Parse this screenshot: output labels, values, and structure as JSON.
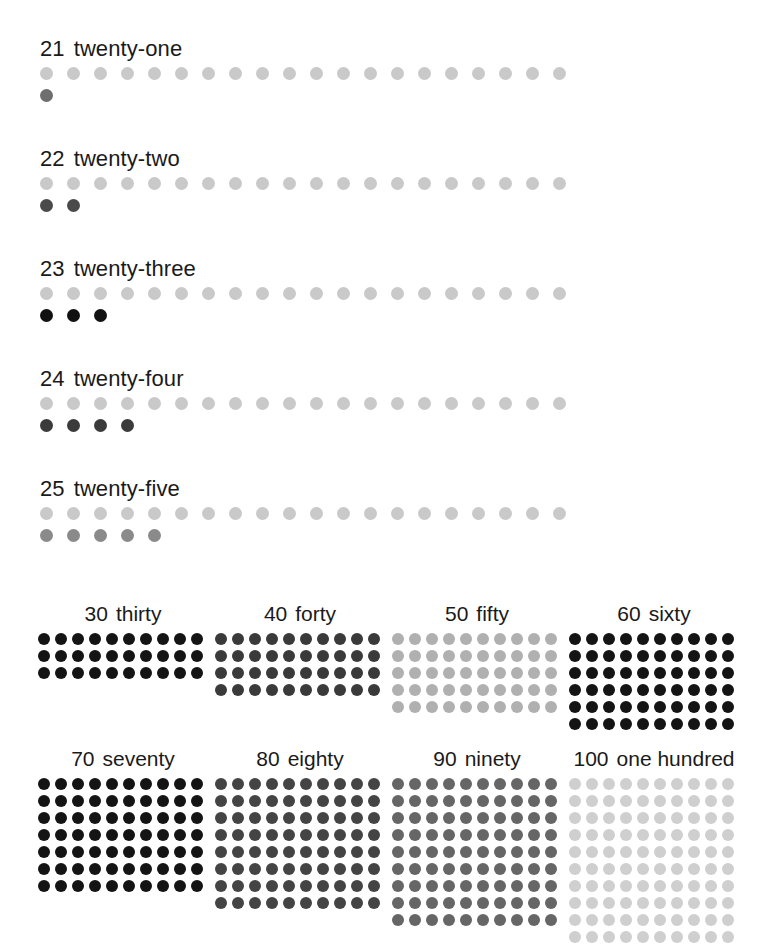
{
  "page": {
    "background_color": "#ffffff",
    "width": 781,
    "height": 927
  },
  "linear_section": {
    "description": "Numbers 21 to 25 shown as a row of twenty faint dots plus the extra ones below",
    "base_row_count": 20,
    "base_dot_color": "#c9c9c9",
    "rows": [
      {
        "number": "21",
        "word": "twenty-one",
        "total": 21,
        "base_dots": 20,
        "extra_dots": 1,
        "extra_dot_color": "#6e6e6e",
        "top": 38
      },
      {
        "number": "22",
        "word": "twenty-two",
        "total": 22,
        "base_dots": 20,
        "extra_dots": 2,
        "extra_dot_color": "#4a4a4a",
        "top": 148
      },
      {
        "number": "23",
        "word": "twenty-three",
        "total": 23,
        "base_dots": 20,
        "extra_dots": 3,
        "extra_dot_color": "#111111",
        "top": 258
      },
      {
        "number": "24",
        "word": "twenty-four",
        "total": 24,
        "base_dots": 20,
        "extra_dots": 4,
        "extra_dot_color": "#3b3b3b",
        "top": 368
      },
      {
        "number": "25",
        "word": "twenty-five",
        "total": 25,
        "base_dots": 20,
        "extra_dots": 5,
        "extra_dot_color": "#8a8a8a",
        "top": 478
      }
    ]
  },
  "grid_section": {
    "description": "Multiples of ten 30 to 100 shown as ten-by-N dot arrays",
    "columns": 10,
    "groups": [
      {
        "number": "30",
        "word": "thirty",
        "total": 30,
        "rows": 3,
        "dot_color": "#141414",
        "left": 38,
        "top": 603
      },
      {
        "number": "40",
        "word": "forty",
        "total": 40,
        "rows": 4,
        "dot_color": "#3a3a3a",
        "left": 215,
        "top": 603
      },
      {
        "number": "50",
        "word": "fifty",
        "total": 50,
        "rows": 5,
        "dot_color": "#b0b0b0",
        "left": 392,
        "top": 603
      },
      {
        "number": "60",
        "word": "sixty",
        "total": 60,
        "rows": 6,
        "dot_color": "#141414",
        "left": 569,
        "top": 603
      },
      {
        "number": "70",
        "word": "seventy",
        "total": 70,
        "rows": 7,
        "dot_color": "#141414",
        "left": 38,
        "top": 748
      },
      {
        "number": "80",
        "word": "eighty",
        "total": 80,
        "rows": 8,
        "dot_color": "#444444",
        "left": 215,
        "top": 748
      },
      {
        "number": "90",
        "word": "ninety",
        "total": 90,
        "rows": 9,
        "dot_color": "#666666",
        "left": 392,
        "top": 748
      },
      {
        "number": "100",
        "word": "one hundred",
        "total": 100,
        "rows": 10,
        "dot_color": "#cfcfcf",
        "left": 569,
        "top": 748
      }
    ]
  }
}
